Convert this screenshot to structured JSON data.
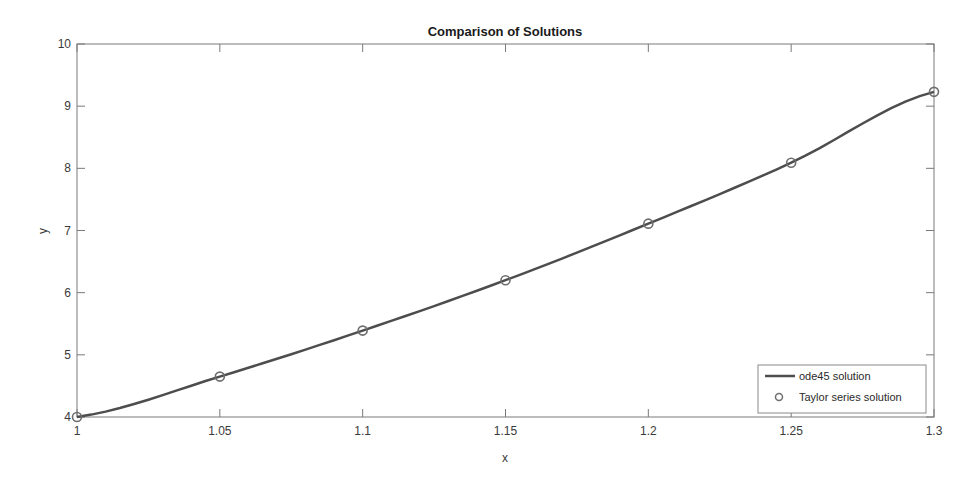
{
  "chart_data": {
    "type": "line",
    "title": "Comparison of Solutions",
    "xlabel": "x",
    "ylabel": "y",
    "xlim": [
      1,
      1.3
    ],
    "ylim": [
      4,
      10
    ],
    "xticks": [
      "1",
      "1.05",
      "1.1",
      "1.15",
      "1.2",
      "1.25",
      "1.3"
    ],
    "yticks": [
      "4",
      "5",
      "6",
      "7",
      "8",
      "9",
      "10"
    ],
    "grid": false,
    "legend_position": "lower right",
    "x": [
      1.0,
      1.05,
      1.1,
      1.15,
      1.2,
      1.25,
      1.3
    ],
    "series": [
      {
        "name": "ode45 solution",
        "style": "solid line",
        "color": "#4d4d4d",
        "values": [
          4.0,
          4.65,
          5.39,
          6.2,
          7.11,
          8.09,
          9.23
        ]
      },
      {
        "name": "Taylor series solution",
        "style": "circle markers",
        "color": "#6e6e6e",
        "values": [
          4.0,
          4.65,
          5.39,
          6.2,
          7.11,
          8.09,
          9.23
        ]
      }
    ]
  }
}
